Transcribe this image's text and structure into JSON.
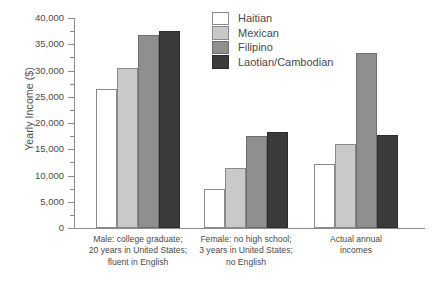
{
  "chart_data": {
    "type": "bar",
    "title": "",
    "subtitle": "",
    "xlabel": "",
    "ylabel": "Yearly Income ($)",
    "ylim": [
      0,
      40000
    ],
    "ytick_values": [
      0,
      5000,
      10000,
      15000,
      20000,
      25000,
      30000,
      35000,
      40000
    ],
    "ytick_labels": [
      "0",
      "5,000",
      "10,000",
      "15,000",
      "20,000",
      "25,000",
      "30,000",
      "35,000",
      "40,000"
    ],
    "minor_tick_interval": 2500,
    "grid": false,
    "legend_position": "top-center",
    "categories": [
      "Male: college graduate; 20 years in United States; fluent in English",
      "Female: no high school; 3 years in United States; no English",
      "Actual annual incomes"
    ],
    "category_label_lines": [
      [
        "Male: college graduate;",
        "20 years in United States;",
        "fluent in English"
      ],
      [
        "Female: no high school;",
        "3 years in United States;",
        "no English"
      ],
      [
        "Actual annual",
        "incomes"
      ]
    ],
    "series": [
      {
        "name": "Haitian",
        "color": "#ffffff",
        "values": [
          26500,
          7500,
          12200
        ]
      },
      {
        "name": "Mexican",
        "color": "#c9c9c9",
        "values": [
          30500,
          11500,
          16000
        ]
      },
      {
        "name": "Filipino",
        "color": "#8f8f8f",
        "values": [
          36800,
          17500,
          33400
        ]
      },
      {
        "name": "Laotian/Cambodian",
        "color": "#3a3a3a",
        "values": [
          37500,
          18300,
          17800
        ]
      }
    ]
  },
  "axis": {
    "line_color": "#8c8c8c",
    "text_color": "#4a4a4a"
  }
}
